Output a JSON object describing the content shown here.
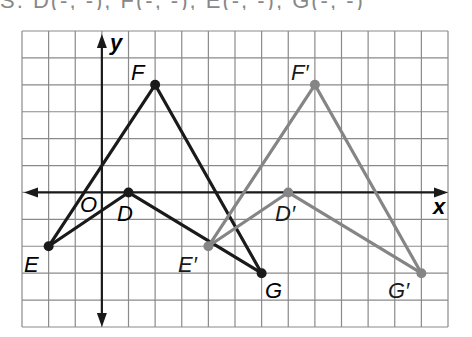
{
  "header_fragment": "S. D(-, -), F(-, -), E(-, -), G(-, -)",
  "grid": {
    "left": 22,
    "top": 31,
    "right": 448,
    "bottom": 327,
    "cols": 16,
    "rows": 11,
    "origin_col": 3,
    "origin_row": 6,
    "line_color": "#8a8a8a"
  },
  "axes": {
    "x_label": "x",
    "y_label": "y",
    "origin_label": "O",
    "color": "#1a1a1a"
  },
  "figures": [
    {
      "name": "DEFG",
      "color": "#1a1a1a",
      "vertices": [
        {
          "label": "D",
          "x": 1,
          "y": 0
        },
        {
          "label": "F",
          "x": 2,
          "y": 4
        },
        {
          "label": "E",
          "x": -2,
          "y": -2
        },
        {
          "label": "G",
          "x": 6,
          "y": -3
        }
      ],
      "edges": [
        [
          "F",
          "E"
        ],
        [
          "E",
          "D"
        ],
        [
          "D",
          "G"
        ],
        [
          "G",
          "F"
        ]
      ]
    },
    {
      "name": "D'E'F'G'",
      "color": "#858585",
      "vertices": [
        {
          "label": "D′",
          "x": 7,
          "y": 0
        },
        {
          "label": "F′",
          "x": 8,
          "y": 4
        },
        {
          "label": "E′",
          "x": 4,
          "y": -2
        },
        {
          "label": "G′",
          "x": 12,
          "y": -3
        }
      ],
      "edges": [
        [
          "F′",
          "E′"
        ],
        [
          "E′",
          "D′"
        ],
        [
          "D′",
          "G′"
        ],
        [
          "G′",
          "F′"
        ]
      ]
    }
  ],
  "labels": {
    "D": "D",
    "E": "E",
    "F": "F",
    "G": "G",
    "D_prime": "D′",
    "E_prime": "E′",
    "F_prime": "F′",
    "G_prime": "G′"
  }
}
